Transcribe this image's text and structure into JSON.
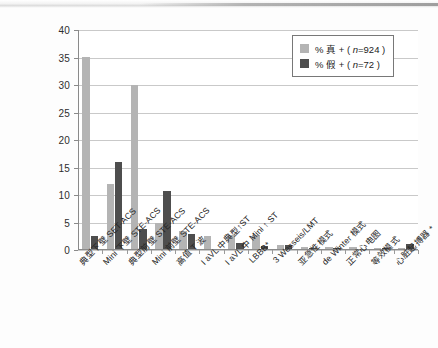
{
  "chart_data": {
    "type": "bar",
    "title": "",
    "xlabel": "",
    "ylabel": "",
    "ylim": [
      0,
      40
    ],
    "ytick_step": 5,
    "yticks": [
      "0",
      "5",
      "10",
      "15",
      "20",
      "25",
      "30",
      "35",
      "40"
    ],
    "grid": true,
    "legend_position": "top-right",
    "categories": [
      "典型下壁 SET-ACS",
      "Mini 下壁 STE-ACS",
      "典型前壁 STE-ACS",
      "Mini 前壁 STE-ACS",
      "高值 T 波",
      "I aVL 中典型↑ST",
      "I aVL 中 Mini ↑ ST",
      "LBBB*",
      "3 Wesseis/LMT",
      "亚急性模式",
      "de Winter 模式",
      "正常心电图",
      "等效模式",
      "心脏起搏器 *"
    ],
    "series": [
      {
        "name": "% 真 + ( n=924 )",
        "color": "#b4b4b4",
        "values": [
          35.0,
          11.8,
          29.8,
          4.7,
          3.2,
          2.4,
          2.5,
          2.5,
          0.8,
          0.3,
          0.3,
          0.3,
          0.1,
          0.2
        ]
      },
      {
        "name": "% 假 + ( n=72 )",
        "color": "#4e4e4e",
        "values": [
          2.3,
          15.8,
          3.7,
          10.6,
          2.7,
          0.0,
          1.1,
          0.5,
          0.8,
          0.2,
          0.2,
          0.0,
          0.1,
          0.9
        ]
      }
    ]
  },
  "legend": {
    "entries": [
      {
        "label_prefix": "% 真 + (",
        "label_n": "n",
        "label_suffix": "=924 )",
        "full": "% 真 + ( n=924 )"
      },
      {
        "label_prefix": "% 假 + (",
        "label_n": "n",
        "label_suffix": "=72 )",
        "full": "% 假 + ( n=72 )"
      }
    ]
  },
  "colors": {
    "true_positive": "#b4b4b4",
    "false_positive": "#4e4e4e",
    "gridline": "#c9c9c9",
    "axis": "#8a8a8a",
    "text": "#262626"
  }
}
